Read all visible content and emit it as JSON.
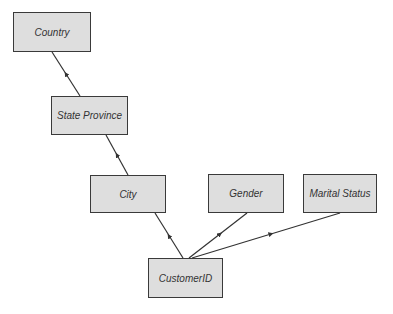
{
  "diagram": {
    "type": "hierarchy",
    "colors": {
      "node_fill": "#dedede",
      "node_border": "#3a3a3a",
      "edge": "#333333",
      "text": "#333333"
    },
    "nodes": {
      "country": {
        "label": "Country"
      },
      "state_province": {
        "label": "State Province"
      },
      "city": {
        "label": "City"
      },
      "gender": {
        "label": "Gender"
      },
      "marital_status": {
        "label": "Marital Status"
      },
      "customer_id": {
        "label": "CustomerID"
      }
    },
    "edges": [
      {
        "from": "State Province",
        "to": "Country"
      },
      {
        "from": "City",
        "to": "State Province"
      },
      {
        "from": "CustomerID",
        "to": "City"
      },
      {
        "from": "CustomerID",
        "to": "Gender"
      },
      {
        "from": "CustomerID",
        "to": "Marital Status"
      }
    ]
  }
}
